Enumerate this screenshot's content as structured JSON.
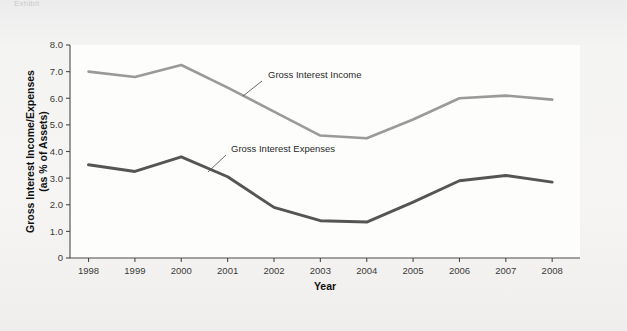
{
  "figure": {
    "caption_fragment": "Exhibit",
    "background_color": "#f2f2f0",
    "plot_background_color": "#fdfdfc"
  },
  "chart_data": {
    "type": "line",
    "title": "",
    "subtitle": "",
    "xlabel": "Year",
    "ylabel": "Gross Interest Income/Expenses (as % of Assets)",
    "ylabel_line1": "Gross Interest Income/Expenses",
    "ylabel_line2": "(as % of Assets)",
    "categories": [
      "1998",
      "1999",
      "2000",
      "2001",
      "2002",
      "2003",
      "2004",
      "2005",
      "2006",
      "2007",
      "2008"
    ],
    "x": [
      1998,
      1999,
      2000,
      2001,
      2002,
      2003,
      2004,
      2005,
      2006,
      2007,
      2008
    ],
    "series": [
      {
        "name": "Gross Interest Income",
        "color": "#9a9a9a",
        "values": [
          7.0,
          6.8,
          7.25,
          6.4,
          5.5,
          4.6,
          4.5,
          5.2,
          6.0,
          6.1,
          5.95
        ],
        "label_x": 2001.35,
        "label_y": 7.05
      },
      {
        "name": "Gross Interest Expenses",
        "color": "#555555",
        "values": [
          3.5,
          3.25,
          3.8,
          3.05,
          1.9,
          1.4,
          1.35,
          2.1,
          2.9,
          3.1,
          2.85
        ],
        "label_x": 2000.75,
        "label_y": 4.28
      }
    ],
    "ylim": [
      0,
      8.0
    ],
    "yticks": [
      0,
      1.0,
      2.0,
      3.0,
      4.0,
      5.0,
      6.0,
      7.0,
      8.0
    ],
    "ytick_labels": [
      "0",
      "1.0",
      "2.0",
      "3.0",
      "4.0",
      "5.0",
      "6.0",
      "7.0",
      "8.0"
    ],
    "xlim": [
      1997.6,
      2008.6
    ],
    "grid": false,
    "legend": "inline-annotations",
    "axes_style": "left-and-bottom-spines"
  }
}
